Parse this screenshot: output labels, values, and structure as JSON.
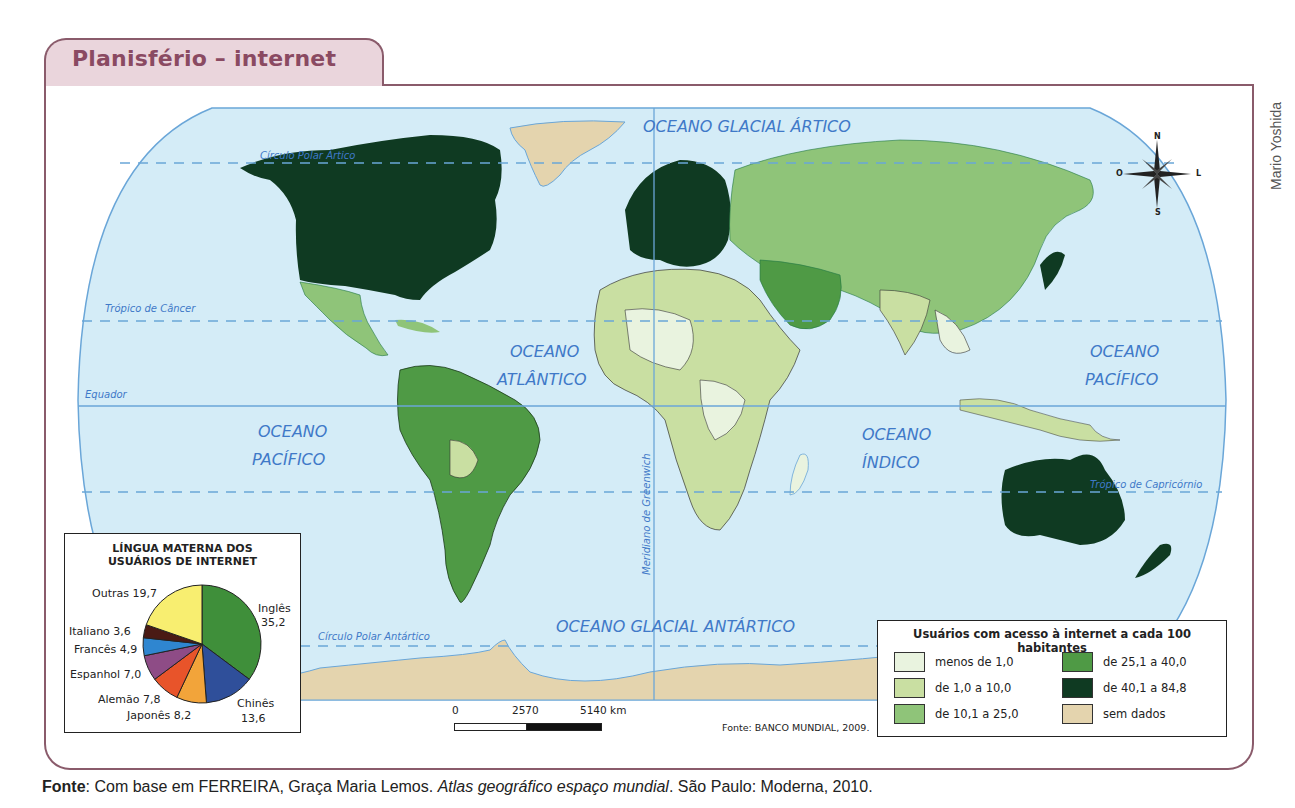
{
  "header": {
    "title": "Planisfério – internet"
  },
  "credit": "Mario Yoshida",
  "map": {
    "oceans": {
      "arctic": "OCEANO GLACIAL ÁRTICO",
      "atlantic_1": "OCEANO",
      "atlantic_2": "ATLÂNTICO",
      "pacific_west_1": "OCEANO",
      "pacific_west_2": "PACÍFICO",
      "pacific_east_1": "OCEANO",
      "pacific_east_2": "PACÍFICO",
      "indian_1": "OCEANO",
      "indian_2": "ÍNDICO",
      "antarctic": "OCEANO GLACIAL ANTÁRTICO"
    },
    "lines": {
      "arctic_circle": "Círculo Polar Ártico",
      "tropic_cancer": "Trópico de Câncer",
      "equator": "Equador",
      "tropic_capricorn": "Trópico de Capricórnio",
      "antarctic_circle": "Círculo Polar Antártico",
      "greenwich": "Meridiano de Greenwich"
    },
    "colors": {
      "ocean": "#d4ecf7",
      "ocean_edge": "#6aa6d8",
      "c1": "#e9f3df",
      "c2": "#c9dfa2",
      "c3": "#8fc479",
      "c4": "#4f9a45",
      "c5": "#0f3a22",
      "nodata": "#e4d4ae"
    }
  },
  "compass": {
    "n": "N",
    "s": "S",
    "e": "L",
    "w": "O"
  },
  "pie": {
    "title_1": "LÍNGUA MATERNA DOS",
    "title_2": "USUÁRIOS DE INTERNET",
    "labels": {
      "ingles_name": "Inglês",
      "ingles_val": "35,2",
      "chines_name": "Chinês",
      "chines_val": "13,6",
      "japones": "Japonês 8,2",
      "alemao": "Alemão 7,8",
      "espanhol": "Espanhol 7,0",
      "frances": "Francês 4,9",
      "italiano": "Italiano 3,6",
      "outras": "Outras 19,7"
    }
  },
  "chart_data": {
    "type": "pie",
    "title": "LÍNGUA MATERNA DOS USUÁRIOS DE INTERNET",
    "categories": [
      "Inglês",
      "Chinês",
      "Japonês",
      "Alemão",
      "Espanhol",
      "Francês",
      "Italiano",
      "Outras"
    ],
    "values": [
      35.2,
      13.6,
      8.2,
      7.8,
      7.0,
      4.9,
      3.6,
      19.7
    ],
    "colors": [
      "#3f8f3a",
      "#2f4f9a",
      "#f2a43a",
      "#e8542a",
      "#8e4c86",
      "#2f86d0",
      "#4a1a14",
      "#f8ee70"
    ]
  },
  "legend": {
    "title": "Usuários com acesso à internet a cada 100 habitantes",
    "items": [
      {
        "label": "menos de 1,0",
        "color": "#e9f3df"
      },
      {
        "label": "de 1,0 a 10,0",
        "color": "#c9dfa2"
      },
      {
        "label": "de 10,1 a 25,0",
        "color": "#8fc479"
      },
      {
        "label": "de 25,1 a 40,0",
        "color": "#4f9a45"
      },
      {
        "label": "de 40,1 a 84,8",
        "color": "#0f3a22"
      },
      {
        "label": "sem dados",
        "color": "#e4d4ae"
      }
    ]
  },
  "scale": {
    "zero": "0",
    "mid": "2570",
    "end": "5140 km"
  },
  "map_source": "Fonte: BANCO MUNDIAL, 2009.",
  "footer": {
    "label": "Fonte",
    "text_1": ": Com base em FERREIRA, Graça Maria Lemos. ",
    "title": "Atlas geográfico espaço mundial",
    "text_2": ". São Paulo: Moderna, 2010."
  }
}
